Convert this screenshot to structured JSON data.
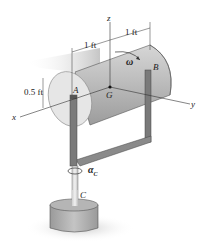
{
  "figure": {
    "labels": {
      "z_axis": "z",
      "x_axis": "x",
      "y_axis": "y",
      "point_A": "A",
      "point_B": "B",
      "point_G": "G",
      "point_C": "C",
      "omega": "ω",
      "alpha": "α",
      "alpha_sub": "C"
    },
    "dimensions": {
      "half_length_left": "1 ft",
      "half_length_right": "1 ft",
      "radius": "0.5 ft"
    },
    "colors": {
      "cylinder_body": "#b8b8b8",
      "cylinder_end": "#e4e4e4",
      "frame": "#7a7a7a",
      "base": "#a8a8a8",
      "shadow": "#d0d0d0",
      "lines": "#333333"
    }
  }
}
